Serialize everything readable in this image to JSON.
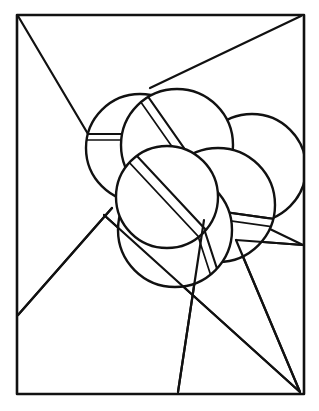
{
  "artwork": {
    "title": "Overlapping Banded Discs",
    "style": "line-art-coloring-page",
    "canvas": {
      "width": 319,
      "height": 411
    },
    "colors": {
      "background": "#ffffff",
      "ink": "#111111"
    },
    "frame": {
      "name": "rectangular-border",
      "left": 16,
      "top": 14,
      "right": 303,
      "bottom": 393,
      "stroke_width": 2.6
    },
    "rays": [
      {
        "name": "ray-top-left",
        "x1": 18,
        "y1": 16,
        "x2": 88,
        "y2": 134
      },
      {
        "name": "ray-top-right",
        "x1": 301,
        "y1": 16,
        "x2": 150,
        "y2": 88
      },
      {
        "name": "ray-lower-left",
        "x1": 18,
        "y1": 315,
        "x2": 112,
        "y2": 208
      },
      {
        "name": "ray-bottom-left-diagonal",
        "x1": 18,
        "y1": 315,
        "x2": 112,
        "y2": 208
      },
      {
        "name": "ray-center-to-bottom-right",
        "x1": 104,
        "y1": 215,
        "x2": 300,
        "y2": 392
      },
      {
        "name": "ray-vertical-drop",
        "x1": 204,
        "y1": 220,
        "x2": 178,
        "y2": 392
      },
      {
        "name": "ray-right-upper-to-corner",
        "x1": 236,
        "y1": 240,
        "x2": 300,
        "y2": 392
      },
      {
        "name": "ray-right-edge-to-corner",
        "x1": 303,
        "y1": 245,
        "x2": 236,
        "y2": 240
      },
      {
        "name": "ray-right-short",
        "x1": 243,
        "y1": 216,
        "x2": 303,
        "y2": 245
      }
    ],
    "discs": [
      {
        "name": "disc-left",
        "cx": 140,
        "cy": 148,
        "r": 54
      },
      {
        "name": "disc-top",
        "cx": 177,
        "cy": 145,
        "r": 56
      },
      {
        "name": "disc-right",
        "cx": 252,
        "cy": 168,
        "r": 54
      },
      {
        "name": "disc-lower-right",
        "cx": 218,
        "cy": 205,
        "r": 57
      },
      {
        "name": "disc-bottom",
        "cx": 175,
        "cy": 230,
        "r": 57
      },
      {
        "name": "disc-center",
        "cx": 167,
        "cy": 197,
        "r": 51
      }
    ],
    "bands": [
      {
        "name": "band-left-horizontal",
        "disc": "disc-left",
        "angle_deg": 0,
        "offset": -14,
        "gap": 6
      },
      {
        "name": "band-top-diagonal",
        "disc": "disc-top",
        "angle_deg": 55,
        "offset": -4,
        "gap": 9
      },
      {
        "name": "band-center-diagonal",
        "disc": "disc-center",
        "angle_deg": 47,
        "offset": -6,
        "gap": 10
      },
      {
        "name": "band-right-horizontal",
        "disc": "disc-lower-right",
        "angle_deg": 8,
        "offset": 6,
        "gap": 8
      },
      {
        "name": "band-bottom-diagonal",
        "disc": "disc-bottom",
        "angle_deg": 72,
        "offset": -28,
        "gap": 8
      }
    ],
    "element_count": {
      "discs": 6,
      "bands": 5,
      "rays": 9
    }
  }
}
